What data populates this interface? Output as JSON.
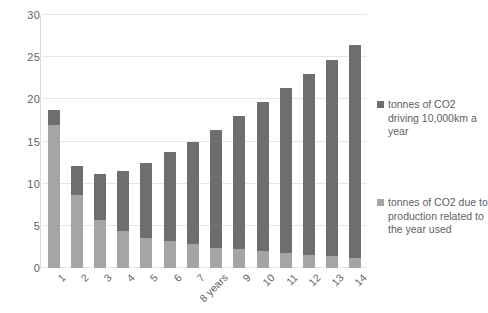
{
  "chart_data": {
    "type": "bar",
    "stacked": true,
    "title": "",
    "subtitle": "",
    "xlabel": "",
    "ylabel": "",
    "ylim": [
      0,
      30
    ],
    "yticks": [
      0,
      5,
      10,
      15,
      20,
      25,
      30
    ],
    "ytick_labels": [
      "0",
      "5",
      "10",
      "15",
      "20",
      "25",
      "30"
    ],
    "grid": "horizontal",
    "legend_position": "right",
    "categories": [
      "1",
      "2",
      "3",
      "4",
      "5",
      "6",
      "7",
      "8 years",
      "9",
      "10",
      "11",
      "12",
      "13",
      "14"
    ],
    "series": [
      {
        "name": "tonnes of CO2 due to production related to the year used",
        "color": "#a5a5a5",
        "stack_order": 0,
        "values": [
          17.0,
          8.7,
          5.7,
          4.4,
          3.6,
          3.2,
          2.8,
          2.4,
          2.2,
          2.0,
          1.8,
          1.6,
          1.4,
          1.2
        ]
      },
      {
        "name": "tonnes of CO2 driving 10,000km a year",
        "color": "#6e6e6e",
        "stack_order": 1,
        "values": [
          1.7,
          3.4,
          5.5,
          7.1,
          8.8,
          10.6,
          12.2,
          14.0,
          15.8,
          17.7,
          19.6,
          21.4,
          23.3,
          25.2
        ]
      }
    ],
    "totals": [
      18.7,
      12.1,
      11.2,
      11.5,
      12.4,
      13.8,
      15.0,
      16.4,
      18.0,
      19.7,
      21.4,
      23.0,
      24.7,
      26.4
    ]
  },
  "legend": {
    "items": [
      {
        "label": "tonnes of CO2 driving 10,000km a year",
        "color": "#6e6e6e",
        "marker": "square-marker"
      },
      {
        "label": "tonnes of CO2 due to production related to the year used",
        "color": "#a5a5a5",
        "marker": "square-marker"
      }
    ]
  },
  "axis_colors": {
    "gridline": "#e6e6e6",
    "axis_line": "#d9d9d9",
    "tick_text": "#5f5f5f"
  }
}
